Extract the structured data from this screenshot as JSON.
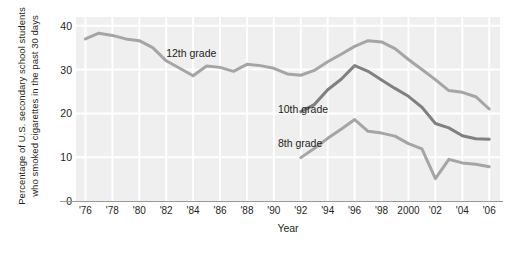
{
  "chart_data": {
    "type": "line",
    "title": "",
    "xlabel": "Year",
    "ylabel_lines": [
      "Percentage of U.S. secondary school students",
      "who smoked cigarettes in the past 30 days"
    ],
    "ylabel": "Percentage of U.S. secondary school students who smoked cigarettes in the past 30 days",
    "ylim": [
      0,
      42
    ],
    "yticks": [
      0,
      10,
      20,
      30,
      40
    ],
    "ytick_labels": [
      "0",
      "10",
      "20",
      "30",
      "40"
    ],
    "xlim": [
      1975.3,
      2006.8
    ],
    "xticks": [
      1976,
      1978,
      1980,
      1982,
      1984,
      1986,
      1988,
      1990,
      1992,
      1994,
      1996,
      1998,
      2000,
      2002,
      2004,
      2006
    ],
    "xtick_labels": [
      "'76",
      "'78",
      "'80",
      "'82",
      "'84",
      "'86",
      "'88",
      "'90",
      "'92",
      "'94",
      "'96",
      "'98",
      "2000",
      "'02",
      "'04",
      "'06"
    ],
    "grid": true,
    "grid_color": "#ffffff",
    "plot_background": "#efefef",
    "legend": "inline-labels",
    "series": [
      {
        "name": "12th grade",
        "color": "#a5a5a5",
        "label_x": 1982.0,
        "label_y": 33.6,
        "x": [
          1976,
          1977,
          1978,
          1979,
          1980,
          1981,
          1982,
          1983,
          1984,
          1985,
          1986,
          1987,
          1988,
          1989,
          1990,
          1991,
          1992,
          1993,
          1994,
          1995,
          1996,
          1997,
          1998,
          1999,
          2000,
          2001,
          2002,
          2003,
          2004,
          2005,
          2006
        ],
        "values": [
          37.0,
          38.3,
          37.8,
          37.0,
          36.6,
          35.0,
          32.0,
          30.3,
          28.6,
          30.8,
          30.5,
          29.6,
          31.2,
          30.9,
          30.3,
          29.0,
          28.7,
          29.8,
          31.8,
          33.5,
          35.3,
          36.6,
          36.3,
          34.8,
          32.3,
          30.0,
          27.7,
          25.2,
          24.8,
          23.8,
          21.0
        ]
      },
      {
        "name": "10th grade",
        "color": "#808080",
        "label_x": 1990.3,
        "label_y": 20.7,
        "x": [
          1992,
          1993,
          1994,
          1995,
          1996,
          1997,
          1998,
          1999,
          2000,
          2001,
          2002,
          2003,
          2004,
          2005,
          2006
        ],
        "values": [
          20.4,
          22.0,
          25.4,
          27.8,
          30.9,
          29.6,
          27.6,
          25.7,
          23.9,
          21.4,
          17.7,
          16.7,
          14.9,
          14.2,
          14.1
        ]
      },
      {
        "name": "8th grade",
        "color": "#a5a5a5",
        "label_x": 1990.3,
        "label_y": 12.9,
        "x": [
          1992,
          1993,
          1994,
          1995,
          1996,
          1997,
          1998,
          1999,
          2000,
          2001,
          2002,
          2003,
          2004,
          2005,
          2006
        ],
        "values": [
          9.9,
          12.0,
          14.3,
          16.4,
          18.6,
          15.9,
          15.5,
          14.8,
          13.1,
          11.9,
          5.1,
          9.5,
          8.7,
          8.4,
          7.8
        ]
      }
    ]
  }
}
